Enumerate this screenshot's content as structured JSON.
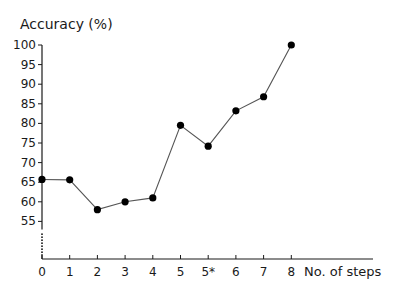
{
  "chart_data": {
    "type": "line",
    "title": "",
    "ylabel": "Accuracy (%)",
    "xlabel": "No. of steps",
    "categories": [
      "0",
      "1",
      "2",
      "3",
      "4",
      "5",
      "5*",
      "6",
      "7",
      "8"
    ],
    "series": [
      {
        "name": "Accuracy",
        "values": [
          65.7,
          65.6,
          58.0,
          60.0,
          61.0,
          79.5,
          74.2,
          83.2,
          86.8,
          100.0
        ]
      }
    ],
    "yticks": [
      55,
      60,
      65,
      70,
      75,
      80,
      85,
      90,
      95,
      100
    ],
    "ylim": [
      55,
      100
    ],
    "y_axis_break": true,
    "grid": false,
    "legend": null,
    "marker": "filled-circle",
    "line_color": "#555555",
    "marker_color": "#000000"
  }
}
